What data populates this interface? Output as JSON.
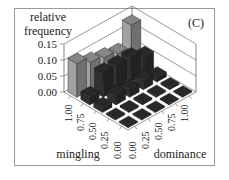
{
  "chart_data": {
    "type": "bar3d",
    "panel_label": "(C)",
    "zlabel": [
      "relative",
      "frequency"
    ],
    "xlabel": "mingling",
    "ylabel": "dominance",
    "z_ticks": [
      "0.00",
      "0.05",
      "0.10",
      "0.15"
    ],
    "zlim": [
      0,
      0.15
    ],
    "mingling_ticks": [
      "0.00",
      "0.25",
      "0.50",
      "0.75",
      "1.00"
    ],
    "dominance_ticks": [
      "0.00",
      "0.25",
      "0.50",
      "0.75",
      "1.00"
    ],
    "mingling": [
      0.0,
      0.25,
      0.5,
      0.75,
      1.0
    ],
    "dominance": [
      0.0,
      0.25,
      0.5,
      0.75,
      1.0
    ],
    "values": [
      [
        0.003,
        0.003,
        0.003,
        0.003,
        0.003
      ],
      [
        0.005,
        0.005,
        0.005,
        0.005,
        0.005
      ],
      [
        0.015,
        0.03,
        0.025,
        0.03,
        0.015
      ],
      [
        0.025,
        0.075,
        0.075,
        0.075,
        0.055
      ],
      [
        0.105,
        0.085,
        0.075,
        0.065,
        0.13
      ]
    ],
    "values_layout": "rows = mingling (0.00..1.00), columns = dominance (0.00..1.00)",
    "grid": true
  },
  "colors": {
    "back_row": "#8c8c8c",
    "front_rows": "#2a2a2a",
    "grid": "#555555"
  }
}
